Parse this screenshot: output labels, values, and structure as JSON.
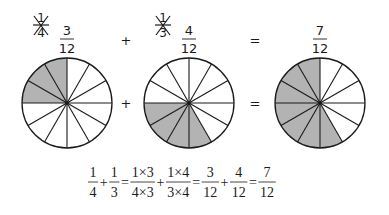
{
  "colors": {
    "shade": "#b3b3b3",
    "stroke": "#1a1a1a",
    "background": "#ffffff"
  },
  "top_row": {
    "first": {
      "original": {
        "num": "1",
        "den": "4"
      },
      "converted": {
        "num": "3",
        "den": "12"
      }
    },
    "plus": "+",
    "second": {
      "original": {
        "num": "1",
        "den": "3"
      },
      "converted": {
        "num": "4",
        "den": "12"
      }
    },
    "equals": "=",
    "result": {
      "num": "7",
      "den": "12"
    }
  },
  "circles": [
    {
      "cx": 67,
      "cy": 103,
      "r": 45,
      "sectors": 12,
      "shaded_from_deg": 180,
      "shaded_to_deg": 270,
      "shaded_count": 3
    },
    {
      "cx": 189,
      "cy": 103,
      "r": 45,
      "sectors": 12,
      "shaded_from_deg": 60,
      "shaded_to_deg": 180,
      "shaded_count": 4
    },
    {
      "cx": 320,
      "cy": 103,
      "r": 45,
      "sectors": 12,
      "shaded_from_deg": 60,
      "shaded_to_deg": 270,
      "shaded_count": 7
    }
  ],
  "middle_row": {
    "plus": "+",
    "equals": "="
  },
  "equation": {
    "terms": [
      {
        "num": "1",
        "den": "4"
      },
      {
        "op": "+"
      },
      {
        "num": "1",
        "den": "3"
      },
      {
        "op": "="
      },
      {
        "num": "1×3",
        "den": "4×3"
      },
      {
        "op": "+"
      },
      {
        "num": "1×4",
        "den": "3×4"
      },
      {
        "op": "="
      },
      {
        "num": "3",
        "den": "12"
      },
      {
        "op": "+"
      },
      {
        "num": "4",
        "den": "12"
      },
      {
        "op": "="
      },
      {
        "num": "7",
        "den": "12"
      }
    ]
  }
}
